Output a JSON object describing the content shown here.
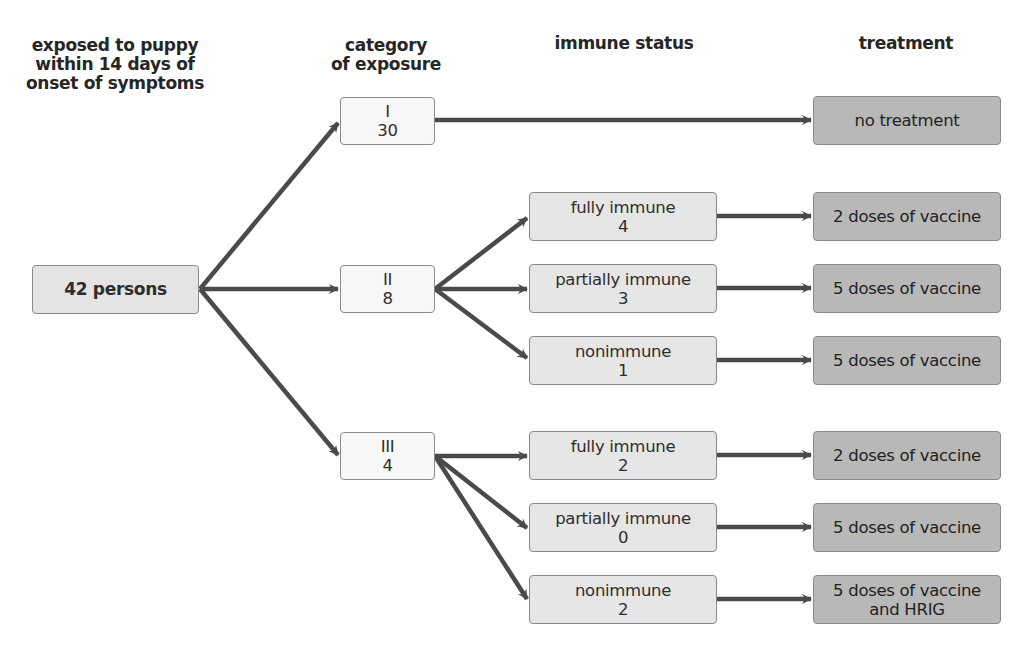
{
  "headers": {
    "exposed": "exposed to puppy\nwithin 14 days of\nonset of symptoms",
    "category": "category\nof exposure",
    "immune": "immune status",
    "treatment": "treatment"
  },
  "root": {
    "label": "42 persons"
  },
  "categories": [
    {
      "name": "I",
      "count": "30"
    },
    {
      "name": "II",
      "count": "8"
    },
    {
      "name": "III",
      "count": "4"
    }
  ],
  "immune": [
    {
      "status": "fully immune",
      "count": "4"
    },
    {
      "status": "partially immune",
      "count": "3"
    },
    {
      "status": "nonimmune",
      "count": "1"
    },
    {
      "status": "fully immune",
      "count": "2"
    },
    {
      "status": "partially immune",
      "count": "0"
    },
    {
      "status": "nonimmune",
      "count": "2"
    }
  ],
  "treatments": [
    {
      "line1": "no treatment",
      "line2": ""
    },
    {
      "line1": "2 doses of vaccine",
      "line2": ""
    },
    {
      "line1": "5 doses of vaccine",
      "line2": ""
    },
    {
      "line1": "5 doses of vaccine",
      "line2": ""
    },
    {
      "line1": "2 doses of vaccine",
      "line2": ""
    },
    {
      "line1": "5 doses of vaccine",
      "line2": ""
    },
    {
      "line1": "5 doses of vaccine",
      "line2": "and HRIG"
    }
  ],
  "colors": {
    "arrow": "#4a4a4a",
    "box_border": "#8a8a8a",
    "category_fill": "#f7f7f7",
    "immune_fill": "#e6e6e6",
    "treatment_fill": "#b8b8b8"
  }
}
